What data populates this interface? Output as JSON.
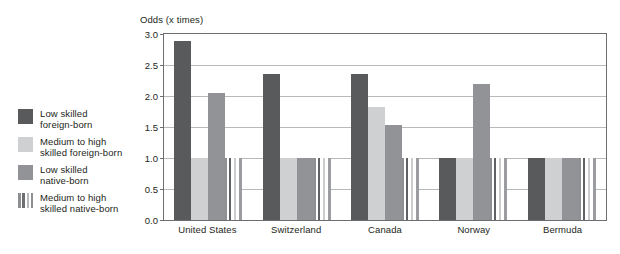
{
  "chart_data": {
    "type": "bar",
    "title": "Odds (x times)",
    "xlabel": "",
    "ylabel": "Odds (x times)",
    "ylim": [
      0.0,
      3.0
    ],
    "ytick_values": [
      3.0,
      2.5,
      2.0,
      1.5,
      1.0,
      0.5,
      0.0
    ],
    "ytick_labels": [
      "3.0",
      "2.5",
      "2.0",
      "1.5",
      "1.0",
      "0.5",
      "0.0"
    ],
    "grid": true,
    "legend_position": "left",
    "categories": [
      "United States",
      "Switzerland",
      "Canada",
      "Norway",
      "Bermuda"
    ],
    "series": [
      {
        "name": "Low skilled foreign-born",
        "color": "#595a5c",
        "fill": "solid",
        "values": [
          2.88,
          2.36,
          2.35,
          1.0,
          1.0
        ]
      },
      {
        "name": "Medium to high skilled foreign-born",
        "color": "#cfd0d2",
        "fill": "solid",
        "values": [
          1.0,
          1.0,
          1.82,
          1.0,
          1.0
        ]
      },
      {
        "name": "Low skilled native-born",
        "color": "#919396",
        "fill": "solid",
        "values": [
          2.05,
          1.0,
          1.54,
          2.19,
          1.0
        ]
      },
      {
        "name": "Medium to high skilled native-born",
        "color": "#8d8f92",
        "fill": "vertical-stripes",
        "values": [
          1.0,
          1.0,
          1.0,
          1.0,
          1.0
        ]
      }
    ]
  },
  "legend": {
    "items": [
      {
        "label_line1": "Low skilled",
        "label_line2": "foreign-born",
        "swatch": "dark-gray-swatch"
      },
      {
        "label_line1": "Medium to high",
        "label_line2": "skilled foreign-born",
        "swatch": "light-gray-swatch"
      },
      {
        "label_line1": "Low skilled",
        "label_line2": "native-born",
        "swatch": "medium-gray-swatch"
      },
      {
        "label_line1": "Medium to high",
        "label_line2": "skilled native-born",
        "swatch": "striped-swatch"
      }
    ]
  }
}
